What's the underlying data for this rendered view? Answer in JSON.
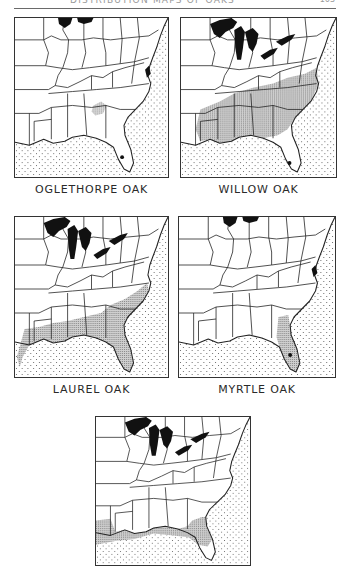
{
  "page": {
    "running_header": "DISTRIBUTION MAPS OF OAKS",
    "page_number": "163"
  },
  "figures": [
    {
      "id": "oglethorpe",
      "caption": "OGLETHORPE OAK",
      "range_description": "small patches in Georgia and South Carolina piedmont"
    },
    {
      "id": "willow",
      "caption": "WILLOW OAK",
      "range_description": "southeastern coastal plain and lower Mississippi valley, north to New Jersey and southern Illinois"
    },
    {
      "id": "laurel",
      "caption": "LAUREL OAK",
      "range_description": "Atlantic and Gulf coastal plain from Virginia to Texas, including Florida"
    },
    {
      "id": "myrtle",
      "caption": "MYRTLE OAK",
      "range_description": "Florida peninsula and adjacent coastal Georgia"
    },
    {
      "id": "fifth",
      "caption": "",
      "range_description": "Gulf coast of Texas/Louisiana and Florida panhandle to Georgia coast"
    }
  ],
  "legend": {
    "range_fill": "#b5b5b5",
    "ocean_pattern": "dotted",
    "great_lakes_fill": "#111111"
  }
}
